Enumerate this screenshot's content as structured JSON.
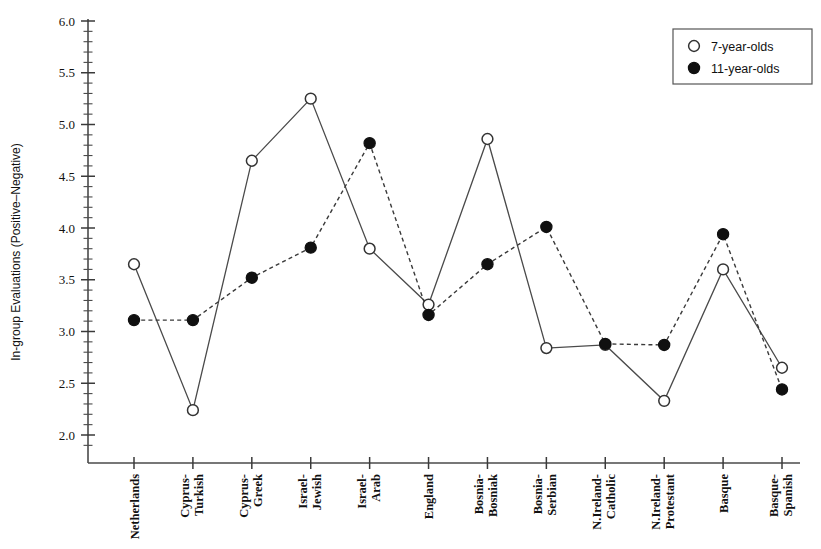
{
  "chart_data": {
    "type": "line",
    "title": "",
    "xlabel": "",
    "ylabel": "In-group Evaluations (Positive–Negative)",
    "ylim": [
      1.85,
      6.05
    ],
    "ytick_labels": [
      "2.0",
      "2.5",
      "3.0",
      "3.5",
      "4.0",
      "4.5",
      "5.0",
      "5.5",
      "6.0"
    ],
    "ytick_values": [
      2.0,
      2.5,
      3.0,
      3.5,
      4.0,
      4.5,
      5.0,
      5.5,
      6.0
    ],
    "minor_tick_step": 0.1,
    "grid": false,
    "legend_position": "top-right",
    "categories": [
      "Netherlands",
      "Cyprus-Turkish",
      "Cyprus-Greek",
      "Israel-Jewish",
      "Israel-Arab",
      "England",
      "Bosnia-Bosniak",
      "Bosnia-Serbian",
      "N.Ireland-Catholic",
      "N.Ireland-Protestant",
      "Basque",
      "Basque-Spanish"
    ],
    "category_lines": [
      [
        "Netherlands"
      ],
      [
        "Cyprus-",
        "Turkish"
      ],
      [
        "Cyprus-",
        "Greek"
      ],
      [
        "Israel-",
        "Jewish"
      ],
      [
        "Israel-",
        "Arab"
      ],
      [
        "England"
      ],
      [
        "Bosnia-",
        "Bosniak"
      ],
      [
        "Bosnia-",
        "Serbian"
      ],
      [
        "N.Ireland-",
        "Catholic"
      ],
      [
        "N.Ireland-",
        "Protestant"
      ],
      [
        "Basque"
      ],
      [
        "Basque-",
        "Spanish"
      ]
    ],
    "series": [
      {
        "name": "7-year-olds",
        "marker": "open-circle",
        "line_style": "solid",
        "color": "#ffffff",
        "values": [
          3.65,
          2.24,
          4.65,
          5.25,
          3.8,
          3.26,
          4.86,
          2.84,
          2.87,
          2.33,
          3.6,
          2.65
        ]
      },
      {
        "name": "11-year-olds",
        "marker": "filled-circle",
        "line_style": "dashed",
        "color": "#101010",
        "values": [
          3.11,
          3.11,
          3.52,
          3.81,
          4.82,
          3.16,
          3.65,
          4.01,
          2.88,
          2.87,
          3.94,
          2.44
        ]
      }
    ]
  },
  "legend": {
    "entries": [
      {
        "label": "7-year-olds",
        "marker": "open-circle"
      },
      {
        "label": "11-year-olds",
        "marker": "filled-circle"
      }
    ]
  },
  "axis": {
    "y_title": "In-group Evaluations (Positive–Negative)"
  }
}
